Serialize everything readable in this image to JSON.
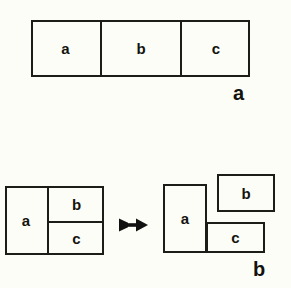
{
  "figure": {
    "background_color": "#fdfdf8",
    "line_color": "#1c1c18",
    "text_color": "#14140f"
  },
  "panels": [
    {
      "caption": "a",
      "description": "single rectangle divided into three side-by-side cells",
      "cells": [
        {
          "label": "a"
        },
        {
          "label": "b"
        },
        {
          "label": "c"
        }
      ]
    },
    {
      "caption": "b",
      "description": "rectangle split into a, b, c then exploded apart",
      "before": {
        "cells": [
          {
            "label": "a"
          },
          {
            "label": "b"
          },
          {
            "label": "c"
          }
        ]
      },
      "operator": {
        "name": "arrow-right",
        "glyph": "➜"
      },
      "after": {
        "cells": [
          {
            "label": "a"
          },
          {
            "label": "b"
          },
          {
            "label": "c"
          }
        ]
      }
    }
  ]
}
